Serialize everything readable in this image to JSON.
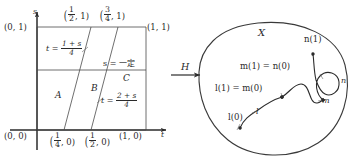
{
  "figure": {
    "map_arrow_label": "H",
    "ink_color": "#2b2b2b"
  },
  "left_diagram": {
    "name": "unit-square-subdivision",
    "axes": {
      "horizontal_label": "t",
      "vertical_label": "s"
    },
    "corner_labels": [
      {
        "id": "bottom-left",
        "text": "(0, 0)"
      },
      {
        "id": "top-left",
        "text": "(0, 1)"
      },
      {
        "id": "top-right",
        "text": "(1, 1)"
      },
      {
        "id": "bottom-right",
        "text": "(1, 0)"
      }
    ],
    "top_labels": [
      {
        "id": "top-half",
        "lead": "(",
        "num": "1",
        "den": "2",
        "tail": ", 1)"
      },
      {
        "id": "top-three-quarter",
        "lead": "(",
        "num": "3",
        "den": "4",
        "tail": ", 1)"
      }
    ],
    "bottom_labels": [
      {
        "id": "bottom-quarter",
        "lead": "(",
        "num": "1",
        "den": "4",
        "tail": ", 0)"
      },
      {
        "id": "bottom-half",
        "lead": "(",
        "num": "1",
        "den": "2",
        "tail": ", 0)"
      }
    ],
    "regions": [
      {
        "id": "region-a",
        "label": "A"
      },
      {
        "id": "region-b",
        "label": "B"
      },
      {
        "id": "region-c",
        "label": "C"
      }
    ],
    "boundary_equations": [
      {
        "id": "left-slant-equation",
        "lhs": "t =",
        "num": "1 + s",
        "den": "4"
      },
      {
        "id": "right-slant-equation",
        "lhs": "t =",
        "num": "2 + s",
        "den": "4"
      }
    ],
    "constant_line_label": "s = 一定"
  },
  "right_diagram": {
    "name": "space-X-with-paths",
    "space_label": "X",
    "path_labels": [
      {
        "id": "path-l",
        "text": "l"
      },
      {
        "id": "path-m",
        "text": "m"
      },
      {
        "id": "path-n",
        "text": "n"
      }
    ],
    "node_labels": [
      {
        "id": "node-l0",
        "text": "l(0)"
      },
      {
        "id": "node-l1-m0",
        "text": "l(1) = m(0)"
      },
      {
        "id": "node-m1-n0",
        "text": "m(1) = n(0)"
      },
      {
        "id": "node-n1",
        "text": "n(1)"
      }
    ]
  }
}
